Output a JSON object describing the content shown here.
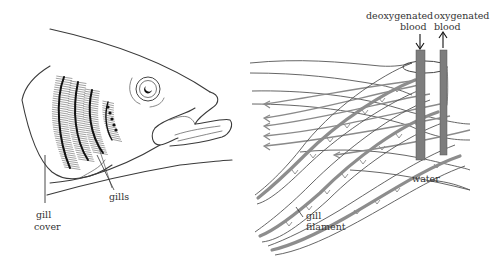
{
  "diagram": {
    "type": "biology-illustration",
    "colors": {
      "ink": "#3a3a3a",
      "vessel": "#7d7d7d",
      "flow": "#8a8a8a",
      "background": "#ffffff"
    },
    "labels": {
      "gills": "gills",
      "gill_cover_line1": "gill",
      "gill_cover_line2": "cover",
      "deoxygenated_line1": "deoxygenated",
      "deoxygenated_line2": "blood",
      "oxygenated_line1": "oxygenated",
      "oxygenated_line2": "blood",
      "water": "water",
      "gill_filament_line1": "gill",
      "gill_filament_line2": "filament"
    },
    "panels": [
      {
        "name": "fish-head",
        "description": "side view of fish head with gill cover cut away showing gills"
      },
      {
        "name": "gill-filament-detail",
        "description": "gill filaments with blood vessels and water flowing in opposite direction"
      }
    ]
  }
}
